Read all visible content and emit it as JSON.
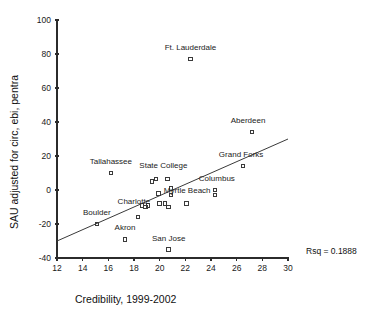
{
  "chart_data": {
    "type": "scatter",
    "title": "",
    "xlabel": "Credibility, 1999-2002",
    "ylabel": "SAU adjusted for circ, ebi, pentra",
    "xlim": [
      12,
      30
    ],
    "ylim": [
      -40,
      100
    ],
    "xticks": [
      12,
      14,
      16,
      18,
      20,
      22,
      24,
      26,
      28,
      30
    ],
    "yticks": [
      -40,
      -20,
      0,
      20,
      40,
      60,
      80,
      100
    ],
    "grid": false,
    "legend": null,
    "annotations": [
      {
        "name": "rsq",
        "text": "Rsq = 0.1888"
      }
    ],
    "fit_line": {
      "name": "regression-line",
      "x_start": 12,
      "y_start": -30,
      "x_end": 30,
      "y_end": 30
    },
    "points": [
      {
        "label": "Ft. Lauderdale",
        "x": 22.4,
        "y": 77,
        "label_dx": 0,
        "label_dy": -9
      },
      {
        "label": "Aberdeen",
        "x": 27.2,
        "y": 34,
        "label_dx": -4,
        "label_dy": -9
      },
      {
        "label": "Grand Forks",
        "x": 26.5,
        "y": 14,
        "label_dx": -2,
        "label_dy": -9
      },
      {
        "label": "Tallahassee",
        "x": 16.2,
        "y": 10,
        "label_dx": 0,
        "label_dy": -9
      },
      {
        "label": "State College",
        "x": 20.6,
        "y": 6.5,
        "label_dx": -4,
        "label_dy": -11
      },
      {
        "label": "Columbus",
        "x": 24.3,
        "y": 0,
        "label_dx": 2,
        "label_dy": -9
      },
      {
        "label": "Myrtle Beach",
        "x": 20.9,
        "y": -3,
        "label_dx": 16,
        "label_dy": -2
      },
      {
        "label": "Charlotte",
        "x": 18.3,
        "y": -16,
        "label_dx": -4,
        "label_dy": -13
      },
      {
        "label": "Boulder",
        "x": 15.1,
        "y": -20,
        "label_dx": 0,
        "label_dy": -9
      },
      {
        "label": "Akron",
        "x": 17.3,
        "y": -29,
        "label_dx": 0,
        "label_dy": -9
      },
      {
        "label": "San Jose",
        "x": 20.7,
        "y": -35,
        "label_dx": 0,
        "label_dy": -9
      },
      {
        "label": "",
        "x": 19.4,
        "y": 5,
        "label_dx": 0,
        "label_dy": 0
      },
      {
        "label": "",
        "x": 19.7,
        "y": 6.5,
        "label_dx": 0,
        "label_dy": 0
      },
      {
        "label": "",
        "x": 20.9,
        "y": 1,
        "label_dx": 0,
        "label_dy": 0
      },
      {
        "label": "",
        "x": 19.9,
        "y": -2,
        "label_dx": 0,
        "label_dy": 0
      },
      {
        "label": "",
        "x": 20.0,
        "y": -8,
        "label_dx": 0,
        "label_dy": 0
      },
      {
        "label": "",
        "x": 20.4,
        "y": -8,
        "label_dx": 0,
        "label_dy": 0
      },
      {
        "label": "",
        "x": 20.7,
        "y": -10,
        "label_dx": 0,
        "label_dy": 0
      },
      {
        "label": "",
        "x": 22.1,
        "y": -8,
        "label_dx": 0,
        "label_dy": 0
      },
      {
        "label": "",
        "x": 24.3,
        "y": -3,
        "label_dx": 0,
        "label_dy": 0
      },
      {
        "label": "",
        "x": 19.1,
        "y": -9,
        "label_dx": 0,
        "label_dy": 0
      },
      {
        "label": "",
        "x": 18.6,
        "y": -9,
        "label_dx": 0,
        "label_dy": 0
      },
      {
        "label": "",
        "x": 18.9,
        "y": -10,
        "label_dx": 0,
        "label_dy": 0
      }
    ]
  }
}
